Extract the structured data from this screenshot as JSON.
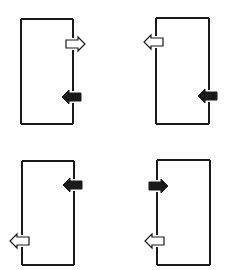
{
  "diagram": {
    "width": 227,
    "height": 270,
    "colors": {
      "background": "#ffffff",
      "line": "#1a1a1a",
      "filled_arrow": "#1a1a1a",
      "hollow_arrow_fill": "#ffffff"
    },
    "panels": [
      {
        "id": "top-left",
        "rect": {
          "x1": 21,
          "y1": 19,
          "x2": 73,
          "y2": 124
        },
        "arrows": [
          {
            "style": "hollow",
            "direction": "right",
            "wall": "right",
            "y": 44
          },
          {
            "style": "filled",
            "direction": "left",
            "wall": "right",
            "y": 97
          }
        ]
      },
      {
        "id": "top-right",
        "rect": {
          "x1": 156,
          "y1": 18,
          "x2": 209,
          "y2": 124
        },
        "arrows": [
          {
            "style": "hollow",
            "direction": "left",
            "wall": "left",
            "y": 42
          },
          {
            "style": "filled",
            "direction": "left",
            "wall": "right",
            "y": 96
          }
        ]
      },
      {
        "id": "bottom-left",
        "rect": {
          "x1": 22,
          "y1": 161,
          "x2": 74,
          "y2": 265
        },
        "arrows": [
          {
            "style": "filled",
            "direction": "left",
            "wall": "right",
            "y": 185
          },
          {
            "style": "hollow",
            "direction": "left",
            "wall": "left",
            "y": 241
          }
        ]
      },
      {
        "id": "bottom-right",
        "rect": {
          "x1": 157,
          "y1": 160,
          "x2": 210,
          "y2": 265
        },
        "arrows": [
          {
            "style": "filled",
            "direction": "right",
            "wall": "left",
            "y": 186
          },
          {
            "style": "hollow",
            "direction": "left",
            "wall": "left",
            "y": 241
          }
        ]
      }
    ]
  }
}
